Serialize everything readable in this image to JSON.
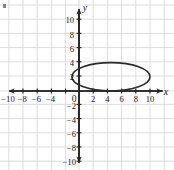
{
  "figure": {
    "name": "coordinate-plane-with-ellipse",
    "background_color": "#ffffff",
    "grid_color": "#d8d8dc",
    "axis_color": "#262626",
    "curve_color": "#2b2b2b",
    "label_color": "#1a1a1a"
  },
  "axes": {
    "x_label": "x",
    "y_label": "y",
    "origin_label": "0",
    "x_ticks": [
      "-10",
      "-8",
      "-6",
      "-4",
      "2",
      "4",
      "6",
      "8",
      "10"
    ],
    "y_ticks": [
      "10",
      "8",
      "6",
      "4",
      "2",
      "-2",
      "-4",
      "-6",
      "-8",
      "-10"
    ],
    "xlim": [
      -11.5,
      11.5
    ],
    "ylim": [
      -11.5,
      11.5
    ],
    "tick_step": 2,
    "grid": true
  },
  "chart_data": {
    "type": "scatter",
    "title": "",
    "xlabel": "x",
    "ylabel": "y",
    "xlim": [
      -11.5,
      11.5
    ],
    "ylim": [
      -11.5,
      11.5
    ],
    "grid": true,
    "curves": [
      {
        "name": "ellipse",
        "shape": "ellipse",
        "center": [
          4.5,
          2
        ],
        "semi_axis_x": 5.5,
        "semi_axis_y": 2,
        "x_range": [
          -1,
          10
        ],
        "y_range": [
          0,
          4
        ],
        "closed": true
      }
    ]
  },
  "tick_positions": {
    "x": [
      {
        "label": "-10",
        "value": -10
      },
      {
        "label": "-8",
        "value": -8
      },
      {
        "label": "-6",
        "value": -6
      },
      {
        "label": "-4",
        "value": -4
      },
      {
        "label": "2",
        "value": 2
      },
      {
        "label": "4",
        "value": 4
      },
      {
        "label": "6",
        "value": 6
      },
      {
        "label": "8",
        "value": 8
      },
      {
        "label": "10",
        "value": 10
      }
    ],
    "y": [
      {
        "label": "10",
        "value": 10
      },
      {
        "label": "8",
        "value": 8
      },
      {
        "label": "6",
        "value": 6
      },
      {
        "label": "4",
        "value": 4
      },
      {
        "label": "2",
        "value": 2
      },
      {
        "label": "-2",
        "value": -2
      },
      {
        "label": "-4",
        "value": -4
      },
      {
        "label": "-6",
        "value": -6
      },
      {
        "label": "-8",
        "value": -8
      },
      {
        "label": "-10",
        "value": -10
      }
    ]
  }
}
